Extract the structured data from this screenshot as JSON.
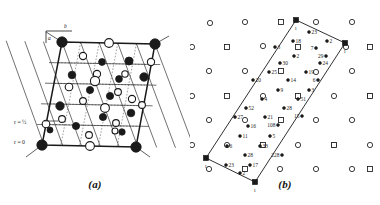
{
  "figure": {
    "background_color": "#ffffff",
    "ink_color": "#1a1a1a",
    "panels": [
      {
        "id": "a",
        "caption": "(a)",
        "description": "Rhombic unit cell outline with a dotted internal sub-lattice grid; filled (black) and open (white) circular atom sites alternate on the grid nodes.",
        "cell": {
          "shape": "rhombus",
          "corners": [
            {
              "x": 62,
              "y": 42
            },
            {
              "x": 155,
              "y": 44
            },
            {
              "x": 136,
              "y": 147
            },
            {
              "x": 42,
              "y": 145
            }
          ]
        },
        "annotations": [
          {
            "name": "r-half-label",
            "text": "r = ½",
            "x": 14,
            "y": 124
          },
          {
            "name": "r-zero-label",
            "text": "r = 0",
            "x": 14,
            "y": 144
          },
          {
            "name": "axis-b-label",
            "text": "b",
            "x": 64,
            "y": 28
          },
          {
            "name": "axis-a-label",
            "text": "a",
            "x": 48,
            "y": 40
          }
        ],
        "site_types": [
          {
            "name": "filled-site",
            "fill": "#1a1a1a",
            "meaning": "atom at r = 0"
          },
          {
            "name": "open-site",
            "fill": "#ffffff",
            "meaning": "atom at r = ½"
          }
        ],
        "filled_sites": [
          {
            "x": 62,
            "y": 42,
            "r": 5.2
          },
          {
            "x": 155,
            "y": 44,
            "r": 5.2
          },
          {
            "x": 42,
            "y": 145,
            "r": 5.2
          },
          {
            "x": 136,
            "y": 147,
            "r": 5.2
          },
          {
            "x": 129,
            "y": 61,
            "r": 4.0
          },
          {
            "x": 102,
            "y": 62,
            "r": 3.4
          },
          {
            "x": 72,
            "y": 75,
            "r": 3.8
          },
          {
            "x": 144,
            "y": 77,
            "r": 4.2
          },
          {
            "x": 119,
            "y": 79,
            "r": 3.4
          },
          {
            "x": 90,
            "y": 90,
            "r": 3.6
          },
          {
            "x": 110,
            "y": 96,
            "r": 3.6
          },
          {
            "x": 60,
            "y": 106,
            "r": 4.2
          },
          {
            "x": 131,
            "y": 113,
            "r": 3.8
          },
          {
            "x": 103,
            "y": 117,
            "r": 3.6
          },
          {
            "x": 76,
            "y": 126,
            "r": 3.6
          },
          {
            "x": 122,
            "y": 132,
            "r": 3.2
          },
          {
            "x": 50,
            "y": 130,
            "r": 3.0
          }
        ],
        "open_sites": [
          {
            "x": 109,
            "y": 43,
            "r": 4.4
          },
          {
            "x": 83,
            "y": 56,
            "r": 3.6
          },
          {
            "x": 151,
            "y": 62,
            "r": 3.6
          },
          {
            "x": 97,
            "y": 74,
            "r": 3.6
          },
          {
            "x": 125,
            "y": 74,
            "r": 3.2
          },
          {
            "x": 69,
            "y": 87,
            "r": 3.8
          },
          {
            "x": 95,
            "y": 81,
            "r": 4.6
          },
          {
            "x": 118,
            "y": 92,
            "r": 3.4
          },
          {
            "x": 132,
            "y": 99,
            "r": 3.6
          },
          {
            "x": 83,
            "y": 101,
            "r": 3.4
          },
          {
            "x": 105,
            "y": 108,
            "r": 4.4
          },
          {
            "x": 62,
            "y": 119,
            "r": 3.4
          },
          {
            "x": 142,
            "y": 105,
            "r": 3.4
          },
          {
            "x": 116,
            "y": 123,
            "r": 3.4
          },
          {
            "x": 46,
            "y": 124,
            "r": 3.8
          },
          {
            "x": 89,
            "y": 135,
            "r": 3.4
          },
          {
            "x": 90,
            "y": 146,
            "r": 4.4
          },
          {
            "x": 115,
            "y": 131,
            "r": 3.0
          }
        ]
      },
      {
        "id": "b",
        "caption": "(b)",
        "description": "Elongated parallelogram supercell containing numbered atom sites; the surrounding field shows a background lattice of small open circles and small open squares.",
        "cell": {
          "shape": "elongated-parallelogram",
          "corners": [
            {
              "x": 106,
              "y": 20
            },
            {
              "x": 155,
              "y": 43
            },
            {
              "x": 65,
              "y": 182
            },
            {
              "x": 16,
              "y": 158
            }
          ],
          "corner_markers": [
            "filled-square",
            "filled-square",
            "filled-square",
            "filled-square"
          ],
          "corner_labels": [
            "1",
            "1",
            "1",
            "1"
          ]
        },
        "numbered_sites": [
          {
            "label": "23",
            "x": 119,
            "y": 32,
            "marker": "filled-dot",
            "label_side": "right"
          },
          {
            "label": "2",
            "x": 137,
            "y": 41,
            "marker": "filled-dot",
            "label_side": "right"
          },
          {
            "label": "18",
            "x": 103,
            "y": 41,
            "marker": "filled-dot",
            "label_side": "right"
          },
          {
            "label": "3",
            "x": 85,
            "y": 47,
            "marker": "filled-dot",
            "label_side": "right"
          },
          {
            "label": "7",
            "x": 126,
            "y": 48,
            "marker": "filled-dot",
            "label_side": "left"
          },
          {
            "label": "2",
            "x": 104,
            "y": 56,
            "marker": "filled-dot",
            "label_side": "right"
          },
          {
            "label": "29",
            "x": 136,
            "y": 56,
            "marker": "filled-dot",
            "label_side": "left"
          },
          {
            "label": "24",
            "x": 130,
            "y": 63,
            "marker": "filled-dot",
            "label_side": "right"
          },
          {
            "label": "30",
            "x": 90,
            "y": 63,
            "marker": "filled-dot",
            "label_side": "right"
          },
          {
            "label": "25",
            "x": 79,
            "y": 72,
            "marker": "filled-dot",
            "label_side": "right"
          },
          {
            "label": "19",
            "x": 116,
            "y": 72,
            "marker": "filled-dot",
            "label_side": "right"
          },
          {
            "label": "20",
            "x": 63,
            "y": 80,
            "marker": "filled-dot",
            "label_side": "right"
          },
          {
            "label": "14",
            "x": 98,
            "y": 80,
            "marker": "filled-dot",
            "label_side": "right"
          },
          {
            "label": "6",
            "x": 128,
            "y": 80,
            "marker": "filled-dot",
            "label_side": "left"
          },
          {
            "label": "9",
            "x": 88,
            "y": 90,
            "marker": "filled-dot",
            "label_side": "right"
          },
          {
            "label": "3",
            "x": 119,
            "y": 90,
            "marker": "filled-dot",
            "label_side": "right"
          },
          {
            "label": "4",
            "x": 72,
            "y": 99,
            "marker": "filled-dot",
            "label_side": "right"
          },
          {
            "label": "51",
            "x": 108,
            "y": 99,
            "marker": "filled-dot",
            "label_side": "right"
          },
          {
            "label": "52",
            "x": 56,
            "y": 108,
            "marker": "filled-dot",
            "label_side": "right"
          },
          {
            "label": "28",
            "x": 94,
            "y": 108,
            "marker": "filled-dot",
            "label_side": "right"
          },
          {
            "label": "27",
            "x": 45,
            "y": 117,
            "marker": "filled-dot",
            "label_side": "right"
          },
          {
            "label": "21",
            "x": 75,
            "y": 117,
            "marker": "filled-dot",
            "label_side": "right"
          },
          {
            "label": "15",
            "x": 112,
            "y": 116,
            "marker": "filled-dot",
            "label_side": "left"
          },
          {
            "label": "16",
            "x": 58,
            "y": 126,
            "marker": "filled-dot",
            "label_side": "right"
          },
          {
            "label": "108",
            "x": 88,
            "y": 125,
            "marker": "filled-dot",
            "label_side": "left"
          },
          {
            "label": "11",
            "x": 50,
            "y": 136,
            "marker": "filled-dot",
            "label_side": "right"
          },
          {
            "label": "5",
            "x": 80,
            "y": 136,
            "marker": "filled-dot",
            "label_side": "right"
          },
          {
            "label": "6",
            "x": 37,
            "y": 146,
            "marker": "filled-dot",
            "label_side": "right"
          },
          {
            "label": "33",
            "x": 70,
            "y": 146,
            "marker": "filled-dot",
            "label_side": "right"
          },
          {
            "label": "28",
            "x": 55,
            "y": 155,
            "marker": "filled-dot",
            "label_side": "right"
          },
          {
            "label": "228",
            "x": 92,
            "y": 155,
            "marker": "filled-dot",
            "label_side": "left"
          },
          {
            "label": "23",
            "x": 36,
            "y": 165,
            "marker": "filled-dot",
            "label_side": "right"
          },
          {
            "label": "17",
            "x": 60,
            "y": 165,
            "marker": "filled-dot",
            "label_side": "right"
          },
          {
            "label": "2",
            "x": 50,
            "y": 173,
            "marker": "filled-dot",
            "label_side": "right"
          }
        ],
        "background_lattice": {
          "circle_marker": {
            "name": "open-circle-site",
            "size": 4.2
          },
          "square_marker": {
            "name": "open-square-site",
            "size": 5.0
          },
          "circles": [
            {
              "x": 20,
              "y": 23
            },
            {
              "x": 55,
              "y": 22
            },
            {
              "x": 126,
              "y": 22
            },
            {
              "x": 162,
              "y": 22
            },
            {
              "x": 2,
              "y": 47
            },
            {
              "x": 73,
              "y": 46
            },
            {
              "x": 156,
              "y": 47
            },
            {
              "x": 19,
              "y": 71
            },
            {
              "x": 55,
              "y": 71
            },
            {
              "x": 126,
              "y": 72
            },
            {
              "x": 162,
              "y": 71
            },
            {
              "x": 2,
              "y": 96
            },
            {
              "x": 73,
              "y": 96
            },
            {
              "x": 144,
              "y": 96
            },
            {
              "x": 180,
              "y": 96
            },
            {
              "x": 19,
              "y": 120
            },
            {
              "x": 55,
              "y": 120
            },
            {
              "x": 126,
              "y": 120
            },
            {
              "x": 162,
              "y": 120
            },
            {
              "x": 2,
              "y": 145
            },
            {
              "x": 37,
              "y": 145
            },
            {
              "x": 108,
              "y": 145
            },
            {
              "x": 144,
              "y": 145
            },
            {
              "x": 180,
              "y": 145
            },
            {
              "x": 19,
              "y": 169
            },
            {
              "x": 90,
              "y": 169
            },
            {
              "x": 126,
              "y": 169
            },
            {
              "x": 162,
              "y": 169
            }
          ],
          "squares": [
            {
              "x": 91,
              "y": 22
            },
            {
              "x": 37,
              "y": 47
            },
            {
              "x": 108,
              "y": 47
            },
            {
              "x": 180,
              "y": 47
            },
            {
              "x": 91,
              "y": 71
            },
            {
              "x": 37,
              "y": 96
            },
            {
              "x": 108,
              "y": 96
            },
            {
              "x": 180,
              "y": 96
            },
            {
              "x": 91,
              "y": 120
            },
            {
              "x": 73,
              "y": 145
            },
            {
              "x": 144,
              "y": 145
            },
            {
              "x": 55,
              "y": 169
            },
            {
              "x": 180,
              "y": 169
            }
          ]
        }
      }
    ]
  }
}
